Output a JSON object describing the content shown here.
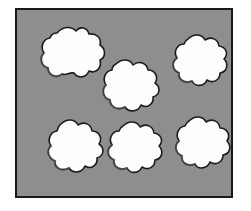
{
  "figure": {
    "title": "",
    "caption": "",
    "page_background": "#ffffff",
    "field_background": "#8e8e8e",
    "field_border_color": "#1a1a1a",
    "field_border_width_px": 2,
    "field_rect": {
      "x": 15,
      "y": 8,
      "width": 218,
      "height": 190
    },
    "object_count": 6,
    "object_fill": "#fdfdfd",
    "object_outline": "#1c1c1c",
    "objects": [
      {
        "id": "blob-1",
        "label": "top-left-blob",
        "center": {
          "x": 54,
          "y": 55
        },
        "approx_radius": 26,
        "row": "top",
        "column": "left"
      },
      {
        "id": "blob-2",
        "label": "top-center-blob",
        "center": {
          "x": 114,
          "y": 85
        },
        "approx_radius": 25,
        "row": "top",
        "column": "center"
      },
      {
        "id": "blob-3",
        "label": "top-right-blob",
        "center": {
          "x": 186,
          "y": 60
        },
        "approx_radius": 25,
        "row": "top",
        "column": "right"
      },
      {
        "id": "blob-4",
        "label": "bottom-left-blob",
        "center": {
          "x": 58,
          "y": 147
        },
        "approx_radius": 25,
        "row": "bottom",
        "column": "left"
      },
      {
        "id": "blob-5",
        "label": "bottom-center-blob",
        "center": {
          "x": 120,
          "y": 147
        },
        "approx_radius": 24,
        "row": "bottom",
        "column": "center"
      },
      {
        "id": "blob-6",
        "label": "bottom-right-blob",
        "center": {
          "x": 186,
          "y": 142
        },
        "approx_radius": 25,
        "row": "bottom",
        "column": "right"
      }
    ]
  }
}
